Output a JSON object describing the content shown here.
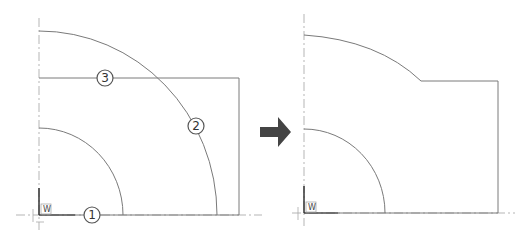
{
  "diagram": {
    "type": "cad-before-after",
    "colors": {
      "line": "#7a7a7a",
      "axis": "#b5b5b5",
      "arrow": "#444444",
      "callout": "#555555"
    },
    "before": {
      "ucs_label": "W",
      "callouts": [
        {
          "id": "1",
          "label": "1",
          "target": "baseline"
        },
        {
          "id": "2",
          "label": "2",
          "target": "outer-arc"
        },
        {
          "id": "3",
          "label": "3",
          "target": "top-edge"
        }
      ]
    },
    "transition_icon": "right-arrow-icon",
    "after": {
      "ucs_label": "W"
    }
  }
}
